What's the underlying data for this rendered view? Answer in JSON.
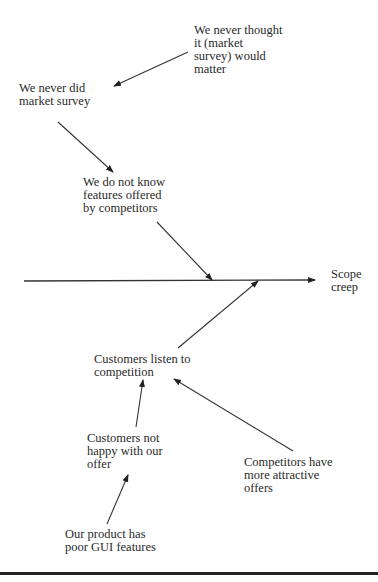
{
  "diagram": {
    "type": "fishbone",
    "effect": {
      "label": "Scope\ncreep"
    },
    "causes": [
      {
        "id": "never_thought",
        "label": "We never thought\nit (market\nsurvey) would\nmatter"
      },
      {
        "id": "never_did",
        "label": "We never did\nmarket survey"
      },
      {
        "id": "dont_know",
        "label": "We do not know\nfeatures offered\nby competitors"
      },
      {
        "id": "listen",
        "label": "Customers listen to\ncompetition"
      },
      {
        "id": "not_happy",
        "label": "Customers not\nhappy with our\noffer"
      },
      {
        "id": "attractive",
        "label": "Competitors have\nmore attractive\noffers"
      },
      {
        "id": "poor_gui",
        "label": "Our product has\npoor GUI features"
      }
    ],
    "arrows": [
      {
        "from": "never_thought",
        "to": "never_did",
        "x1": 188,
        "y1": 52,
        "x2": 114,
        "y2": 86
      },
      {
        "from": "never_did",
        "to": "dont_know",
        "x1": 58,
        "y1": 122,
        "x2": 113,
        "y2": 172
      },
      {
        "from": "dont_know",
        "to": "spine",
        "x1": 157,
        "y1": 222,
        "x2": 212,
        "y2": 280
      },
      {
        "from": "listen",
        "to": "spine",
        "x1": 178,
        "y1": 348,
        "x2": 258,
        "y2": 281
      },
      {
        "from": "not_happy",
        "to": "listen",
        "x1": 136,
        "y1": 427,
        "x2": 143,
        "y2": 380
      },
      {
        "from": "attractive",
        "to": "listen",
        "x1": 293,
        "y1": 451,
        "x2": 174,
        "y2": 379
      },
      {
        "from": "poor_gui",
        "to": "not_happy",
        "x1": 107,
        "y1": 524,
        "x2": 128,
        "y2": 475
      }
    ],
    "spine": {
      "x1": 24,
      "y1": 281,
      "x2": 315,
      "y2": 280
    }
  }
}
